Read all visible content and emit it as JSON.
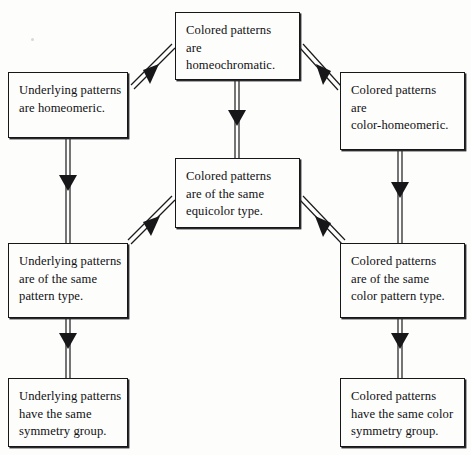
{
  "diagram": {
    "type": "flowchart",
    "background_color": "#fdfdfb",
    "box_border_color": "#17171a",
    "arrow_color": "#1a1a1d",
    "nodes": [
      {
        "id": "colored-homeochromatic",
        "text": "Colored patterns\nare\nhomeochromatic.",
        "x": 175,
        "y": 12,
        "width": 125,
        "height": 68
      },
      {
        "id": "underlying-homeomeric",
        "text": "Underlying patterns\nare homeomeric.",
        "x": 8,
        "y": 72,
        "width": 120,
        "height": 66
      },
      {
        "id": "colored-color-homeomeric",
        "text": "Colored patterns\nare\ncolor-homeomeric.",
        "x": 340,
        "y": 72,
        "width": 125,
        "height": 78
      },
      {
        "id": "colored-equicolor-type",
        "text": "Colored patterns\nare of the same\nequicolor type.",
        "x": 175,
        "y": 158,
        "width": 125,
        "height": 70
      },
      {
        "id": "underlying-pattern-type",
        "text": "Underlying patterns\nare of the same\npattern type.",
        "x": 8,
        "y": 243,
        "width": 120,
        "height": 75
      },
      {
        "id": "colored-color-pattern-type",
        "text": "Colored patterns\nare of the same\ncolor pattern type.",
        "x": 340,
        "y": 243,
        "width": 125,
        "height": 75
      },
      {
        "id": "underlying-symmetry-group",
        "text": "Underlying patterns\nhave the same\nsymmetry group.",
        "x": 8,
        "y": 378,
        "width": 120,
        "height": 69
      },
      {
        "id": "colored-color-symmetry-group",
        "text": "Colored patterns\nhave the same color\nsymmetry group.",
        "x": 340,
        "y": 378,
        "width": 125,
        "height": 69
      }
    ],
    "edges": [
      {
        "id": "edge-top-to-left-upper",
        "from": "colored-homeochromatic",
        "to": "underlying-homeomeric",
        "style": "double-line",
        "direction": "down-left"
      },
      {
        "id": "edge-top-to-right-upper",
        "from": "colored-homeochromatic",
        "to": "colored-color-homeomeric",
        "style": "double-line",
        "direction": "down-right"
      },
      {
        "id": "edge-top-to-center",
        "from": "colored-homeochromatic",
        "to": "colored-equicolor-type",
        "style": "double-line",
        "direction": "down"
      },
      {
        "id": "edge-left-upper-to-mid",
        "from": "underlying-homeomeric",
        "to": "underlying-pattern-type",
        "style": "double-line",
        "direction": "down"
      },
      {
        "id": "edge-right-upper-to-mid",
        "from": "colored-color-homeomeric",
        "to": "colored-color-pattern-type",
        "style": "double-line",
        "direction": "down"
      },
      {
        "id": "edge-center-to-left-mid",
        "from": "colored-equicolor-type",
        "to": "underlying-pattern-type",
        "style": "double-line",
        "direction": "down-left"
      },
      {
        "id": "edge-center-to-right-mid",
        "from": "colored-equicolor-type",
        "to": "colored-color-pattern-type",
        "style": "double-line",
        "direction": "down-right"
      },
      {
        "id": "edge-left-mid-to-bottom",
        "from": "underlying-pattern-type",
        "to": "underlying-symmetry-group",
        "style": "double-line",
        "direction": "down"
      },
      {
        "id": "edge-right-mid-to-bottom",
        "from": "colored-color-pattern-type",
        "to": "colored-color-symmetry-group",
        "style": "double-line",
        "direction": "down"
      }
    ]
  }
}
